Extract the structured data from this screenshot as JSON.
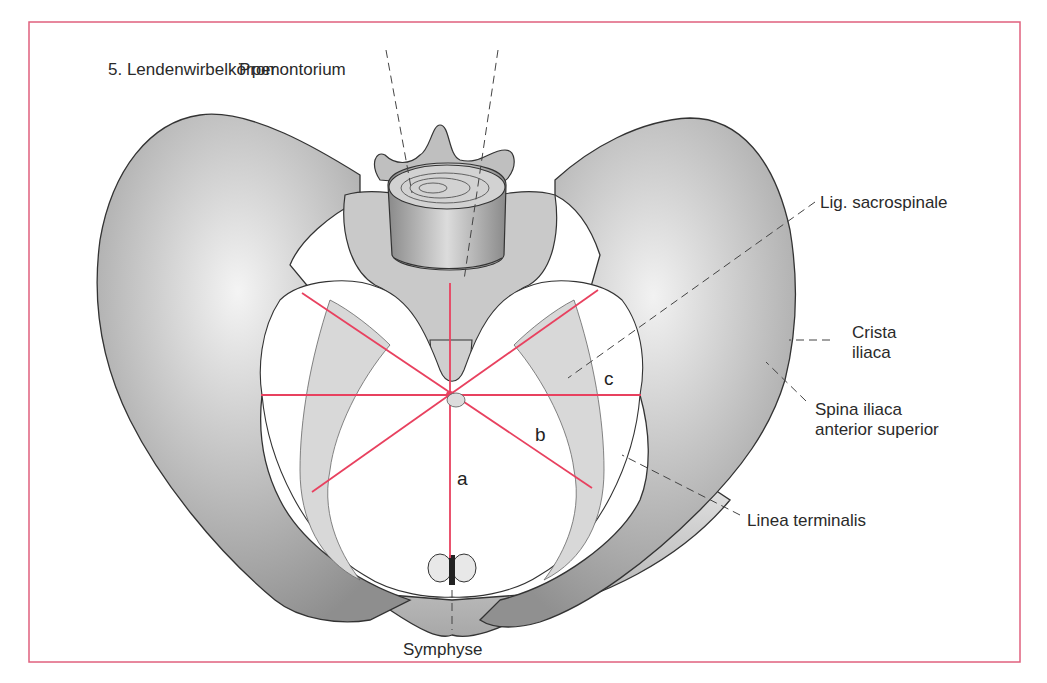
{
  "figure": {
    "frame_color": "#e0607e",
    "measure_line_color": "#e8415f",
    "bone_outline_color": "#333333",
    "leader_line_color": "#444444"
  },
  "labels": {
    "lendenwirbel": "5. Lendenwirbelkörper",
    "promontorium": "Promontorium",
    "lig_sacrospinale": "Lig. sacrospinale",
    "crista_iliaca_1": "Crista",
    "crista_iliaca_2": "iliaca",
    "spina_1": "Spina iliaca",
    "spina_2": "anterior superior",
    "linea_terminalis": "Linea terminalis",
    "symphyse": "Symphyse"
  },
  "measurements": {
    "a": "a",
    "b": "b",
    "c": "c"
  }
}
